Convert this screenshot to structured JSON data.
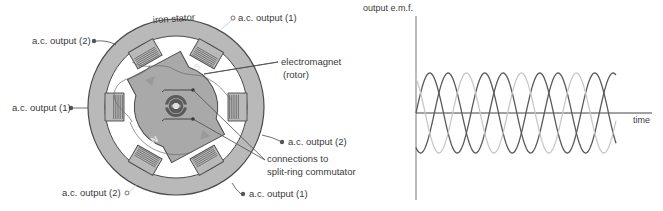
{
  "diagram": {
    "labels": {
      "iron_stator": "iron stator",
      "electromagnet_line1": "electromagnet",
      "electromagnet_line2": "(rotor)",
      "connections_line1": "connections to",
      "connections_line2": "split-ring commutator",
      "ac_output_1_top": "a.c. output (1)",
      "ac_output_2_top_left": "a.c. output (2)",
      "ac_output_1_left": "a.c. output (1)",
      "ac_output_2_right": "a.c. output (2)",
      "ac_output_2_bottom_left": "a.c. output (2)",
      "ac_output_1_bottom_right": "a.c. output (1)"
    },
    "rotor_pole_marks": [
      "S",
      "N"
    ],
    "colors": {
      "stator": "#b9b9b9",
      "rotor": "#a9a9a9",
      "outline": "#4a4a4a",
      "coil": "#6a6a6a",
      "text": "#3a3a3a"
    }
  },
  "chart_data": {
    "type": "line",
    "title": "",
    "xlabel": "time",
    "ylabel": "output e.m.f.",
    "grid": false,
    "legend": null,
    "x_range": [
      0,
      3.65
    ],
    "y_range": [
      -1,
      1
    ],
    "x_unit": "cycles",
    "series": [
      {
        "name": "phase 1",
        "color": "#5a5a5a",
        "phase_deg": 0,
        "amplitude": 1,
        "cycles": 3.65
      },
      {
        "name": "phase 2",
        "color": "#5a5a5a",
        "phase_deg": -120,
        "amplitude": 1,
        "cycles": 3.65
      },
      {
        "name": "phase 3",
        "color": "#c8c8c8",
        "phase_deg": -240,
        "amplitude": 1,
        "cycles": 3.65
      }
    ]
  }
}
